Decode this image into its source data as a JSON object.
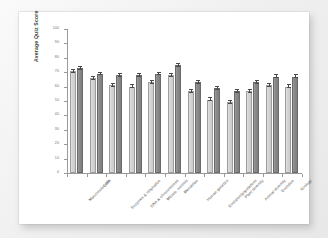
{
  "figure": {
    "background_color": "#ffffff",
    "page_background_color": "#f1f1f1"
  },
  "chart_data": {
    "type": "bar",
    "title": "",
    "subtitle": "",
    "xlabel": "",
    "ylabel": "Average Quiz Score",
    "ylim": [
      0,
      100
    ],
    "yticks": [
      "0",
      "10",
      "20",
      "30",
      "40",
      "50",
      "60",
      "70",
      "80",
      "90",
      "100"
    ],
    "grid": false,
    "legend": "none",
    "orientation": "vertical",
    "error_bars": true,
    "categories": [
      "Macromolecules",
      "Cells",
      "Enzymes & respiration",
      "DNA & chromosomes",
      "Mitosis, meiosis",
      "Mendelian",
      "Human genetics",
      "Evolution/populations",
      "Plant diversity",
      "Animal diversity",
      "Evolution",
      "Ecology"
    ],
    "series": [
      {
        "name": "Group 1",
        "color": "#d4d4d4",
        "values": [
          71,
          66,
          61,
          60,
          63,
          68,
          57,
          51,
          49,
          57,
          61,
          60
        ],
        "errors": [
          1.0,
          1.0,
          1.0,
          1.0,
          1.0,
          1.0,
          1.0,
          1.0,
          1.0,
          1.0,
          1.0,
          1.0
        ]
      },
      {
        "name": "Group 2",
        "color": "#888888",
        "values": [
          73,
          69,
          68,
          68,
          69,
          75,
          63,
          59,
          57,
          63,
          67,
          67
        ],
        "errors": [
          1.0,
          1.0,
          1.0,
          1.0,
          1.0,
          1.0,
          1.0,
          1.0,
          1.0,
          1.0,
          1.0,
          1.0
        ]
      }
    ]
  }
}
